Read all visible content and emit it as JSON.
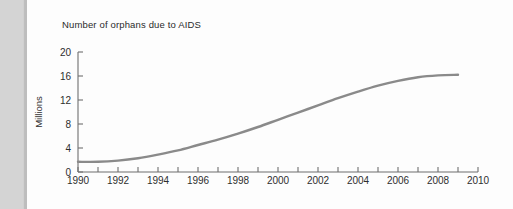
{
  "page": {
    "background_color": "#d4d4d4",
    "sheet_color": "#fdfdfd"
  },
  "chart_data": {
    "type": "line",
    "title": "Number of orphans due to AIDS",
    "xlabel": "",
    "ylabel": "Millions",
    "xlim": [
      1990,
      2010
    ],
    "ylim": [
      0,
      20
    ],
    "grid": false,
    "legend": null,
    "line_color": "#8a8a8a",
    "axis_color": "#6f6f6f",
    "y_ticks": [
      0,
      4,
      8,
      12,
      16,
      20
    ],
    "y_tick_labels": [
      "0",
      "4",
      "8",
      "12",
      "16",
      "20"
    ],
    "y_minor_step": 4,
    "x_ticks": [
      1990,
      1991,
      1992,
      1993,
      1994,
      1995,
      1996,
      1997,
      1998,
      1999,
      2000,
      2001,
      2002,
      2003,
      2004,
      2005,
      2006,
      2007,
      2008,
      2009,
      2010
    ],
    "x_tick_labels": [
      "1990",
      "",
      "1992",
      "",
      "1994",
      "",
      "1996",
      "",
      "1998",
      "",
      "2000",
      "",
      "2002",
      "",
      "2004",
      "",
      "2006",
      "",
      "2008",
      "",
      "2010"
    ],
    "x_labeled_ticks": [
      1990,
      1992,
      1994,
      1996,
      1998,
      2000,
      2002,
      2004,
      2006,
      2008,
      2010
    ],
    "x_labeled_text": [
      "1990",
      "1992",
      "1994",
      "1996",
      "1998",
      "2000",
      "2002",
      "2004",
      "2006",
      "2008",
      "2010"
    ],
    "series": [
      {
        "name": "Number of orphans due to AIDS",
        "x": [
          1990,
          1991,
          1992,
          1993,
          1994,
          1995,
          1996,
          1997,
          1998,
          1999,
          2000,
          2001,
          2002,
          2003,
          2004,
          2005,
          2006,
          2007,
          2008,
          2009
        ],
        "values": [
          1.7,
          1.7,
          1.9,
          2.3,
          2.9,
          3.6,
          4.5,
          5.4,
          6.4,
          7.5,
          8.7,
          9.9,
          11.1,
          12.3,
          13.4,
          14.4,
          15.2,
          15.8,
          16.1,
          16.2
        ]
      }
    ]
  }
}
